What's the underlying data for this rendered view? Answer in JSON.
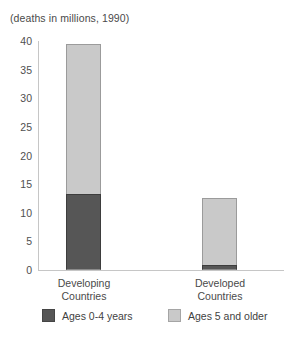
{
  "chart_data": {
    "type": "bar",
    "subtype": "stacked",
    "title": "(deaths in millions, 1990)",
    "xlabel": "",
    "ylabel": "",
    "ylim": [
      0,
      40
    ],
    "yticks": [
      40,
      35,
      30,
      25,
      20,
      15,
      10,
      5,
      0
    ],
    "grid": false,
    "legend_position": "bottom",
    "categories": [
      "Developing Countries",
      "Developed Countries"
    ],
    "category_lines": [
      [
        "Developing",
        "Countries"
      ],
      [
        "Developed",
        "Countries"
      ]
    ],
    "series": [
      {
        "name": "Ages 0-4 years",
        "color": "#565656",
        "values": [
          13.3,
          0.9
        ]
      },
      {
        "name": "Ages 5 and older",
        "color": "#c9c9c9",
        "values": [
          26.1,
          11.6
        ]
      }
    ],
    "totals": [
      39.4,
      12.5
    ]
  },
  "colors": {
    "dark": "#565656",
    "light": "#c9c9c9",
    "axis": "#c6c6c6",
    "text": "#4a4a4a",
    "background": "#ffffff"
  }
}
